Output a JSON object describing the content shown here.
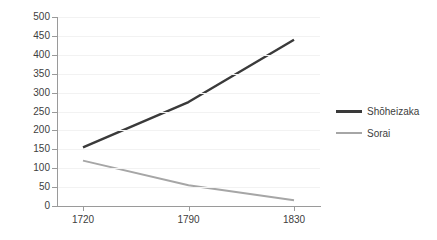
{
  "chart_data": {
    "type": "line",
    "title": "",
    "xlabel": "",
    "ylabel": "",
    "x": [
      "1720",
      "1790",
      "1830"
    ],
    "categories": [
      "1720",
      "1790",
      "1830"
    ],
    "series": [
      {
        "name": "Shōheizaka",
        "values": [
          155,
          275,
          440
        ],
        "color": "#3a3a3a"
      },
      {
        "name": "Sorai",
        "values": [
          120,
          55,
          15
        ],
        "color": "#a6a6a6"
      }
    ],
    "ylim": [
      0,
      500
    ],
    "ytick_step": 50,
    "yticks": [
      "0",
      "50",
      "100",
      "150",
      "200",
      "250",
      "300",
      "350",
      "400",
      "450",
      "500"
    ],
    "grid": true,
    "legend_position": "right"
  },
  "legend": {
    "items": [
      {
        "label": "Shōheizaka"
      },
      {
        "label": "Sorai"
      }
    ]
  }
}
